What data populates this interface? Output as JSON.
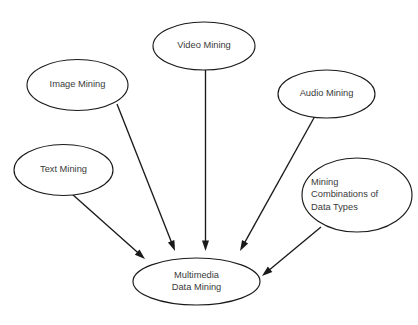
{
  "diagram": {
    "background_color": "#ffffff",
    "stroke_color": "#1a1a1a",
    "text_color": "#3a3a3a",
    "nodes": [
      {
        "id": "text-mining",
        "label": "Text Mining",
        "lines": [
          "Text Mining"
        ],
        "align": "center",
        "cx": 63.5,
        "cy": 170,
        "rx": 49.5,
        "ry": 25.5
      },
      {
        "id": "image-mining",
        "label": "Image Mining",
        "lines": [
          "Image Mining"
        ],
        "align": "center",
        "cx": 77.5,
        "cy": 85,
        "rx": 50.5,
        "ry": 25.5
      },
      {
        "id": "video-mining",
        "label": "Video Mining",
        "lines": [
          "Video Mining"
        ],
        "align": "center",
        "cx": 204,
        "cy": 46,
        "rx": 51,
        "ry": 24
      },
      {
        "id": "audio-mining",
        "label": "Audio Mining",
        "lines": [
          "Audio Mining"
        ],
        "align": "center",
        "cx": 326.5,
        "cy": 94,
        "rx": 48.5,
        "ry": 24
      },
      {
        "id": "mining-combinations",
        "label": "Mining Combinations of Data Types",
        "lines": [
          "Mining",
          "Combinations of",
          "Data Types"
        ],
        "align": "left",
        "cx": 357,
        "cy": 195,
        "rx": 55,
        "ry": 37
      },
      {
        "id": "multimedia-data-mining",
        "label": "Multimedia Data Mining",
        "lines": [
          "Multimedia",
          "Data Mining"
        ],
        "align": "center",
        "cx": 196.5,
        "cy": 281.5,
        "rx": 63.5,
        "ry": 23.5
      }
    ],
    "edges": [
      {
        "id": "edge-text-to-center",
        "from": "text-mining",
        "to": "multimedia-data-mining",
        "x1": 72,
        "y1": 194,
        "x2": 145,
        "y2": 259
      },
      {
        "id": "edge-image-to-center",
        "from": "image-mining",
        "to": "multimedia-data-mining",
        "x1": 117,
        "y1": 104,
        "x2": 175,
        "y2": 251
      },
      {
        "id": "edge-video-to-center",
        "from": "video-mining",
        "to": "multimedia-data-mining",
        "x1": 205.5,
        "y1": 70,
        "x2": 205.5,
        "y2": 251
      },
      {
        "id": "edge-audio-to-center",
        "from": "audio-mining",
        "to": "multimedia-data-mining",
        "x1": 315,
        "y1": 116,
        "x2": 240,
        "y2": 251
      },
      {
        "id": "edge-combinations-to-center",
        "from": "mining-combinations",
        "to": "multimedia-data-mining",
        "x1": 321,
        "y1": 227,
        "x2": 262,
        "y2": 276
      }
    ]
  }
}
